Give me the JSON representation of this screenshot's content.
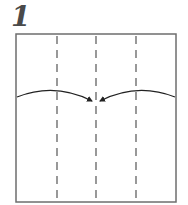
{
  "step": {
    "number": "1"
  },
  "diagram": {
    "type": "origami-fold-step",
    "paper": {
      "shape": "square",
      "border_color": "#6e6e6e",
      "fill": "#ffffff"
    },
    "fold_lines": {
      "style": "valley-dashed",
      "count": 3,
      "color": "#555555"
    },
    "arrows": [
      {
        "name": "left-flap-to-center",
        "direction": "right"
      },
      {
        "name": "right-flap-to-center",
        "direction": "left"
      }
    ],
    "colors": {
      "arrow": "#222222",
      "step_number": "#4a4a4a"
    }
  }
}
